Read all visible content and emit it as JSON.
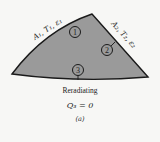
{
  "diagram": {
    "surfaces": [
      {
        "id": "1",
        "label": "A₁, T₁, ε₁"
      },
      {
        "id": "2",
        "label": "A₂, T₂, ε₂"
      },
      {
        "id": "3",
        "label": "3"
      }
    ],
    "caption_line1": "Reradiating",
    "caption_line2": "Q₃ = 0",
    "figure_tag": "(a)",
    "colors": {
      "fill": "#9a9a9a",
      "stroke": "#1a1a1a",
      "background": "#f7f7f5"
    }
  }
}
